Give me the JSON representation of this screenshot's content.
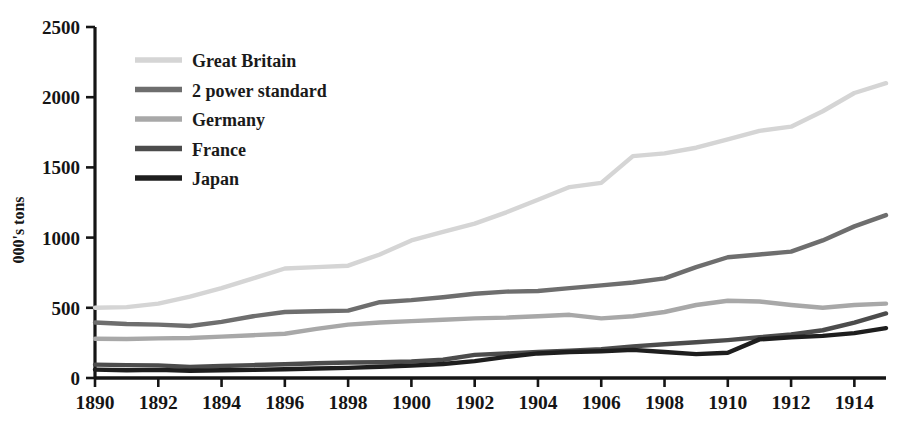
{
  "chart_data": {
    "type": "line",
    "title": "",
    "xlabel": "",
    "ylabel": "000's tons",
    "xlim": [
      1890,
      1915
    ],
    "ylim": [
      0,
      2500
    ],
    "grid": false,
    "legend_position": "top-left",
    "x_tick_labels": [
      "1890",
      "1892",
      "1894",
      "1896",
      "1898",
      "1900",
      "1902",
      "1904",
      "1906",
      "1908",
      "1910",
      "1912",
      "1914"
    ],
    "x_ticks": [
      1890,
      1892,
      1894,
      1896,
      1898,
      1900,
      1902,
      1904,
      1906,
      1908,
      1910,
      1912,
      1914
    ],
    "y_tick_labels": [
      "0",
      "500",
      "1000",
      "1500",
      "2000",
      "2500"
    ],
    "y_ticks": [
      0,
      500,
      1000,
      1500,
      2000,
      2500
    ],
    "x": [
      1890,
      1891,
      1892,
      1893,
      1894,
      1895,
      1896,
      1897,
      1898,
      1899,
      1900,
      1901,
      1902,
      1903,
      1904,
      1905,
      1906,
      1907,
      1908,
      1909,
      1910,
      1911,
      1912,
      1913,
      1914,
      1915
    ],
    "series": [
      {
        "name": "Great Britain",
        "color": "#d5d5d5",
        "values": [
          500,
          505,
          530,
          580,
          640,
          710,
          780,
          790,
          800,
          880,
          980,
          1040,
          1100,
          1180,
          1270,
          1360,
          1390,
          1580,
          1600,
          1640,
          1700,
          1760,
          1790,
          1900,
          2030,
          2100
        ]
      },
      {
        "name": "2 power standard",
        "color": "#6e6e6e",
        "values": [
          395,
          385,
          380,
          370,
          400,
          440,
          470,
          475,
          480,
          540,
          555,
          575,
          600,
          615,
          620,
          640,
          660,
          680,
          710,
          790,
          860,
          880,
          900,
          980,
          1080,
          1160
        ]
      },
      {
        "name": "Germany",
        "color": "#a8a8a8",
        "values": [
          280,
          278,
          282,
          285,
          295,
          305,
          315,
          350,
          380,
          395,
          405,
          415,
          425,
          430,
          440,
          450,
          425,
          440,
          470,
          520,
          550,
          545,
          520,
          500,
          520,
          530
        ]
      },
      {
        "name": "France",
        "color": "#4c4c4c",
        "values": [
          95,
          92,
          90,
          78,
          85,
          92,
          98,
          105,
          110,
          112,
          118,
          130,
          165,
          175,
          185,
          195,
          205,
          225,
          240,
          255,
          270,
          290,
          310,
          340,
          395,
          460
        ]
      },
      {
        "name": "Japan",
        "color": "#1e1e1e",
        "values": [
          60,
          55,
          58,
          52,
          55,
          58,
          62,
          68,
          72,
          80,
          88,
          100,
          120,
          150,
          175,
          185,
          190,
          200,
          185,
          170,
          180,
          275,
          290,
          300,
          320,
          355
        ]
      }
    ]
  },
  "legend": {
    "items": [
      {
        "label": "Great Britain"
      },
      {
        "label": "2 power standard"
      },
      {
        "label": "Germany"
      },
      {
        "label": "France"
      },
      {
        "label": "Japan"
      }
    ]
  }
}
